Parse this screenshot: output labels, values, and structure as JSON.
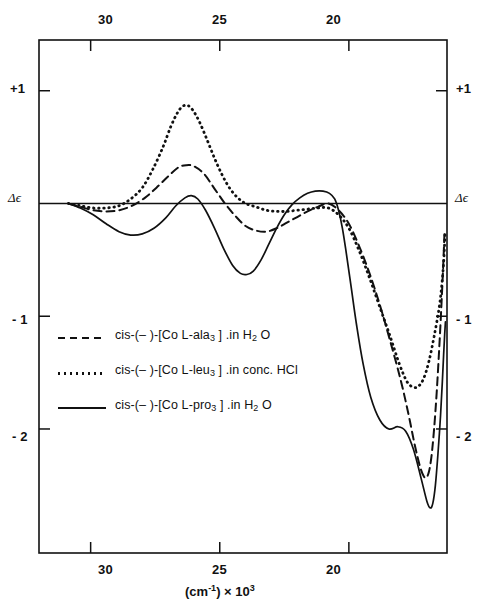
{
  "chart_data": {
    "type": "line",
    "title": "",
    "xlabel": "(cm⁻¹) × 10³",
    "ylabel": "Δε",
    "x_ticks": [
      30,
      25,
      20
    ],
    "x_tick_labels": [
      "30",
      "25",
      "20"
    ],
    "y_ticks": [
      1,
      0,
      -1,
      -2
    ],
    "y_tick_labels": [
      "+1",
      "Δϵ",
      "- 1",
      "- 2"
    ],
    "xlim": [
      32.0,
      16.2
    ],
    "ylim": [
      -3.1,
      1.45
    ],
    "x_axis_top": true,
    "x_axis_bottom": true,
    "y_axis_left": true,
    "y_axis_right": true,
    "grid": false,
    "zero_line": true,
    "legend_position": "lower-left-inside",
    "series": [
      {
        "name": "cis-(-)-[Co L-ala3].in H2O",
        "style": "dashed",
        "color": "#111111",
        "points": [
          [
            30.86,
            0.0
          ],
          [
            30.4,
            -0.03
          ],
          [
            29.9,
            -0.06
          ],
          [
            29.4,
            -0.07
          ],
          [
            28.9,
            -0.06
          ],
          [
            28.4,
            -0.02
          ],
          [
            27.9,
            0.05
          ],
          [
            27.45,
            0.14
          ],
          [
            27.0,
            0.24
          ],
          [
            26.6,
            0.32
          ],
          [
            26.3,
            0.34
          ],
          [
            26.0,
            0.33
          ],
          [
            25.6,
            0.26
          ],
          [
            25.2,
            0.13
          ],
          [
            24.8,
            0.0
          ],
          [
            24.4,
            -0.11
          ],
          [
            24.0,
            -0.2
          ],
          [
            23.6,
            -0.24
          ],
          [
            23.2,
            -0.25
          ],
          [
            22.8,
            -0.22
          ],
          [
            22.4,
            -0.17
          ],
          [
            22.0,
            -0.12
          ],
          [
            21.6,
            -0.07
          ],
          [
            21.2,
            -0.03
          ],
          [
            20.8,
            0.0
          ],
          [
            20.4,
            -0.06
          ],
          [
            20.0,
            -0.18
          ],
          [
            19.6,
            -0.38
          ],
          [
            19.2,
            -0.62
          ],
          [
            18.8,
            -0.9
          ],
          [
            18.4,
            -1.22
          ],
          [
            18.0,
            -1.56
          ],
          [
            17.7,
            -1.86
          ],
          [
            17.45,
            -2.14
          ],
          [
            17.25,
            -2.33
          ],
          [
            17.1,
            -2.42
          ],
          [
            17.0,
            -2.43
          ],
          [
            16.9,
            -2.38
          ],
          [
            16.8,
            -2.24
          ],
          [
            16.7,
            -2.0
          ],
          [
            16.6,
            -1.68
          ],
          [
            16.5,
            -1.28
          ],
          [
            16.42,
            -0.92
          ],
          [
            16.36,
            -0.62
          ],
          [
            16.32,
            -0.4
          ],
          [
            16.3,
            -0.27
          ]
        ]
      },
      {
        "name": "cis-(-)-[Co L-leu3].in conc. HCl",
        "style": "dotted",
        "color": "#111111",
        "points": [
          [
            30.86,
            0.0
          ],
          [
            30.4,
            -0.02
          ],
          [
            29.9,
            -0.04
          ],
          [
            29.4,
            -0.04
          ],
          [
            28.9,
            -0.02
          ],
          [
            28.45,
            0.04
          ],
          [
            28.0,
            0.14
          ],
          [
            27.6,
            0.3
          ],
          [
            27.2,
            0.5
          ],
          [
            26.9,
            0.68
          ],
          [
            26.65,
            0.8
          ],
          [
            26.45,
            0.86
          ],
          [
            26.25,
            0.87
          ],
          [
            26.05,
            0.83
          ],
          [
            25.8,
            0.73
          ],
          [
            25.5,
            0.57
          ],
          [
            25.2,
            0.4
          ],
          [
            24.9,
            0.25
          ],
          [
            24.6,
            0.13
          ],
          [
            24.3,
            0.05
          ],
          [
            24.0,
            0.0
          ],
          [
            23.6,
            -0.03
          ],
          [
            23.2,
            -0.06
          ],
          [
            22.8,
            -0.07
          ],
          [
            22.4,
            -0.07
          ],
          [
            22.0,
            -0.06
          ],
          [
            21.6,
            -0.05
          ],
          [
            21.2,
            -0.04
          ],
          [
            20.8,
            -0.04
          ],
          [
            20.4,
            -0.1
          ],
          [
            20.0,
            -0.22
          ],
          [
            19.6,
            -0.42
          ],
          [
            19.2,
            -0.66
          ],
          [
            18.8,
            -0.92
          ],
          [
            18.4,
            -1.18
          ],
          [
            18.05,
            -1.42
          ],
          [
            17.75,
            -1.58
          ],
          [
            17.5,
            -1.63
          ],
          [
            17.3,
            -1.62
          ],
          [
            17.1,
            -1.55
          ],
          [
            16.9,
            -1.4
          ],
          [
            16.7,
            -1.18
          ],
          [
            16.5,
            -0.92
          ],
          [
            16.4,
            -0.72
          ],
          [
            16.33,
            -0.52
          ],
          [
            16.29,
            -0.34
          ],
          [
            16.27,
            -0.24
          ]
        ]
      },
      {
        "name": "cis-(-)-[Co L-pro3].in H2O",
        "style": "solid",
        "color": "#111111",
        "points": [
          [
            30.86,
            0.0
          ],
          [
            30.4,
            -0.04
          ],
          [
            29.9,
            -0.1
          ],
          [
            29.4,
            -0.18
          ],
          [
            28.9,
            -0.25
          ],
          [
            28.45,
            -0.28
          ],
          [
            28.0,
            -0.27
          ],
          [
            27.55,
            -0.22
          ],
          [
            27.1,
            -0.13
          ],
          [
            26.7,
            -0.02
          ],
          [
            26.35,
            0.05
          ],
          [
            26.1,
            0.07
          ],
          [
            25.85,
            0.04
          ],
          [
            25.55,
            -0.06
          ],
          [
            25.2,
            -0.22
          ],
          [
            24.85,
            -0.4
          ],
          [
            24.5,
            -0.55
          ],
          [
            24.2,
            -0.62
          ],
          [
            23.95,
            -0.63
          ],
          [
            23.7,
            -0.6
          ],
          [
            23.4,
            -0.5
          ],
          [
            23.1,
            -0.36
          ],
          [
            22.8,
            -0.22
          ],
          [
            22.5,
            -0.1
          ],
          [
            22.2,
            -0.01
          ],
          [
            21.9,
            0.05
          ],
          [
            21.6,
            0.09
          ],
          [
            21.3,
            0.11
          ],
          [
            21.0,
            0.11
          ],
          [
            20.75,
            0.09
          ],
          [
            20.55,
            0.04
          ],
          [
            20.4,
            -0.06
          ],
          [
            20.25,
            -0.22
          ],
          [
            20.1,
            -0.44
          ],
          [
            19.9,
            -0.76
          ],
          [
            19.7,
            -1.08
          ],
          [
            19.45,
            -1.42
          ],
          [
            19.15,
            -1.72
          ],
          [
            18.8,
            -1.92
          ],
          [
            18.45,
            -2.0
          ],
          [
            18.1,
            -1.98
          ],
          [
            17.8,
            -2.02
          ],
          [
            17.5,
            -2.18
          ],
          [
            17.2,
            -2.44
          ],
          [
            16.98,
            -2.64
          ],
          [
            16.85,
            -2.7
          ],
          [
            16.75,
            -2.66
          ],
          [
            16.65,
            -2.5
          ],
          [
            16.55,
            -2.22
          ],
          [
            16.45,
            -1.88
          ],
          [
            16.38,
            -1.58
          ],
          [
            16.33,
            -1.34
          ],
          [
            16.29,
            -1.16
          ],
          [
            16.26,
            -1.05
          ]
        ]
      }
    ]
  },
  "axes": {
    "top_ticks": [
      "30",
      "25",
      "20"
    ],
    "bottom_ticks": [
      "30",
      "25",
      "20"
    ],
    "left_ticks": [
      "+1",
      "Δϵ",
      "- 1",
      "- 2"
    ],
    "right_ticks": [
      "+1",
      "Δϵ",
      "- 1",
      "- 2"
    ],
    "x_axis_title_main": "(cm",
    "x_axis_title_sup": "-1",
    "x_axis_title_mid": ") × 10",
    "x_axis_title_exp": "3"
  },
  "legend": {
    "items": [
      {
        "style": "dashed",
        "prefix": "cis-(– )-[Co L-ala",
        "sub": "3",
        "suffix": " ] .in H",
        "sub2": "2",
        "tail": " O"
      },
      {
        "style": "dotted",
        "prefix": "cis-(– )-[Co L-leu",
        "sub": "3",
        "suffix": " ] .in conc. HCl",
        "sub2": "",
        "tail": ""
      },
      {
        "style": "solid",
        "prefix": "cis-(– )-[Co L-pro",
        "sub": "3",
        "suffix": " ] .in H",
        "sub2": "2",
        "tail": " O"
      }
    ]
  },
  "colors": {
    "ink": "#111111",
    "background": "#ffffff"
  }
}
